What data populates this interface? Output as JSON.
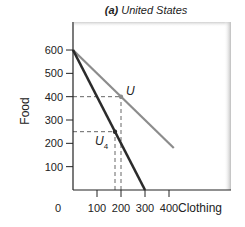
{
  "chart_data": {
    "type": "line",
    "title": "(a) United States",
    "title_prefix": "(a)",
    "title_main": "United States",
    "xlabel": "Clothing",
    "ylabel": "Food",
    "xlim": [
      0,
      650
    ],
    "ylim": [
      0,
      720
    ],
    "x_ticks": [
      100,
      200,
      300,
      400
    ],
    "x_tick_labels": [
      "100",
      "200",
      "300",
      "400"
    ],
    "y_ticks": [
      100,
      200,
      300,
      400,
      500,
      600
    ],
    "y_tick_labels": [
      "100",
      "200",
      "300",
      "400",
      "500",
      "600"
    ],
    "origin_label": "0",
    "grid": false,
    "series": [
      {
        "name": "Production possibility frontier (dark)",
        "color": "#2b2b2b",
        "points": [
          [
            0,
            600
          ],
          [
            300,
            0
          ]
        ]
      },
      {
        "name": "Trade line (gray)",
        "color": "#8c8c8c",
        "points": [
          [
            0,
            600
          ],
          [
            420,
            180
          ]
        ]
      }
    ],
    "annotations": [
      {
        "label": "U",
        "subscript": "",
        "x": 200,
        "y": 400,
        "color": "#8c8c8c"
      },
      {
        "label": "U",
        "subscript": "4",
        "x": 175,
        "y": 250,
        "color": "#2b2b2b"
      }
    ],
    "guides": [
      {
        "type": "dashed",
        "from": [
          0,
          400
        ],
        "to": [
          200,
          400
        ]
      },
      {
        "type": "dashed",
        "from": [
          200,
          0
        ],
        "to": [
          200,
          400
        ]
      },
      {
        "type": "dashed",
        "from": [
          0,
          250
        ],
        "to": [
          175,
          250
        ]
      },
      {
        "type": "dashed",
        "from": [
          175,
          0
        ],
        "to": [
          175,
          250
        ]
      }
    ]
  }
}
